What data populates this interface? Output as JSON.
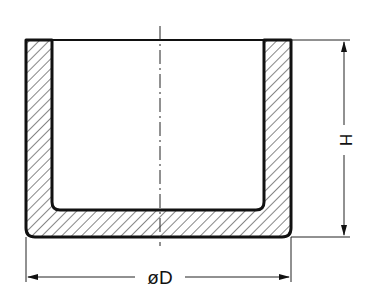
{
  "drawing": {
    "type": "cross-section of cylindrical cup / crucible",
    "labels": {
      "diameter": "øD",
      "height": "H"
    },
    "colors": {
      "line": "#111111",
      "background": "#ffffff"
    }
  }
}
